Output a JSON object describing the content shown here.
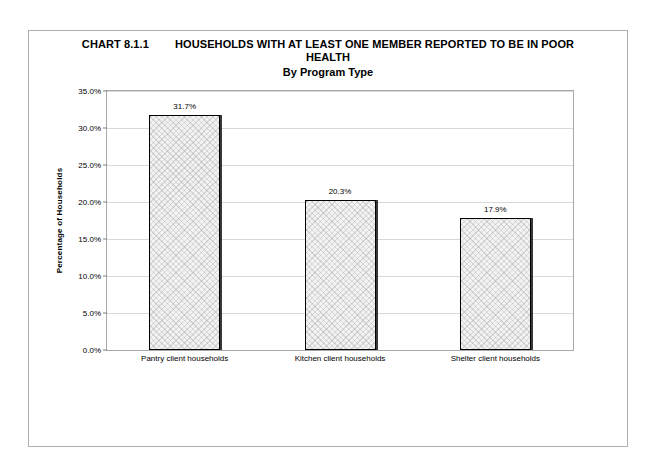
{
  "page": {
    "background_color": "#ffffff",
    "frame_color": "#b0b0b0"
  },
  "title": {
    "chart_number": "CHART 8.1.1",
    "main_line_1": "HOUSEHOLDS WITH AT LEAST ONE MEMBER REPORTED TO BE IN POOR",
    "main_line_2": "HEALTH",
    "subtitle": "By Program Type"
  },
  "chart_data": {
    "type": "bar",
    "subtitle": "By Program Type",
    "categories": [
      "Pantry client households",
      "Kitchen client households",
      "Shelter client households"
    ],
    "values": [
      31.7,
      20.3,
      17.9
    ],
    "value_labels": [
      "31.7%",
      "20.3%",
      "17.9%"
    ],
    "xlabel": "",
    "ylabel": "Percentage of Households",
    "ylim": [
      0,
      35
    ],
    "ytick_step": 5,
    "ytick_labels": [
      "0.0%",
      "5.0%",
      "10.0%",
      "15.0%",
      "20.0%",
      "25.0%",
      "30.0%",
      "35.0%"
    ],
    "ytick_values": [
      0,
      5,
      10,
      15,
      20,
      25,
      30,
      35
    ],
    "grid": "horizontal",
    "legend": "none",
    "bar_fill_color": "#f2f2f2",
    "bar_border_color": "#000000",
    "gridline_color": "#d9d9d9",
    "axis_color": "#a9a9a9"
  }
}
